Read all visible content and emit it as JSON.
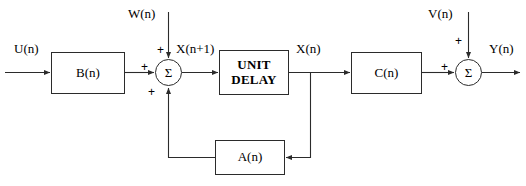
{
  "diagram": {
    "stroke_color": "#2b2b2b",
    "background": "#ffffff",
    "blocks": [
      {
        "id": "b",
        "label": "B(n)"
      },
      {
        "id": "unit_delay",
        "label_line1": "UNIT",
        "label_line2": "DELAY"
      },
      {
        "id": "c",
        "label": "C(n)"
      },
      {
        "id": "a",
        "label": "A(n)"
      }
    ],
    "summing_junctions": [
      {
        "id": "sum_left",
        "symbol": "Σ",
        "signs": {
          "left": "+",
          "top": "+",
          "bottom": "+"
        }
      },
      {
        "id": "sum_right",
        "symbol": "Σ",
        "signs": {
          "left": "+",
          "top": "+"
        }
      }
    ],
    "signals": {
      "input_u": "U(n)",
      "noise_w": "W(n)",
      "state_next": "X(n+1)",
      "state": "X(n)",
      "noise_v": "V(n)",
      "output_y": "Y(n)"
    }
  }
}
